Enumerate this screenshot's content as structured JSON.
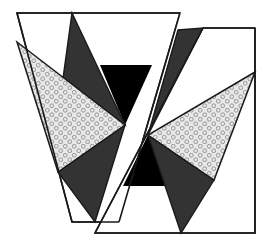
{
  "figure": {
    "canvas": {
      "width": 267,
      "height": 249,
      "background": "#ffffff"
    },
    "colors": {
      "background": "#ffffff",
      "outline": "#1a1a1a",
      "dark_gray": "#333333",
      "black": "#000000",
      "dotted_fill": "#e8e8e8",
      "dot_stroke": "#8c8c8c",
      "panel_fill": "#ffffff"
    },
    "stroke_width": 1.6,
    "pattern": {
      "name": "small-open-circles",
      "tile": 9,
      "radius": 1.9,
      "stroke_width": 0.9
    },
    "shapes": [
      {
        "name": "left-panel-outline",
        "kind": "polygon",
        "fill": "panel_fill",
        "stroke": "outline",
        "points": "17,13 180,13 119,222 72,222"
      },
      {
        "name": "left-dark-triangle-upper",
        "kind": "polygon",
        "fill": "dark_gray",
        "stroke": "outline",
        "points": "72,13 125,125 62,86"
      },
      {
        "name": "left-black-wedge",
        "kind": "polygon",
        "fill": "black",
        "stroke": "none",
        "points": "100,65 152,65 125,125"
      },
      {
        "name": "left-dotted-triangle",
        "kind": "polygon",
        "fill": "dotted_fill",
        "stroke": "outline",
        "points": "17,42 125,125 58,172"
      },
      {
        "name": "left-dark-triangle-lower",
        "kind": "polygon",
        "fill": "dark_gray",
        "stroke": "outline",
        "points": "58,172 125,125 95,222"
      },
      {
        "name": "right-panel-outline",
        "kind": "polygon",
        "fill": "panel_fill",
        "stroke": "outline",
        "points": "203,28 255,28 255,233 95,233"
      },
      {
        "name": "right-dark-triangle-upper",
        "kind": "polygon",
        "fill": "dark_gray",
        "stroke": "outline",
        "points": "203,28 148,135 178,30"
      },
      {
        "name": "right-black-wedge",
        "kind": "polygon",
        "fill": "black",
        "stroke": "none",
        "points": "123,186 175,186 148,135"
      },
      {
        "name": "right-dotted-triangle",
        "kind": "polygon",
        "fill": "dotted_fill",
        "stroke": "outline",
        "points": "255,72 148,135 214,180"
      },
      {
        "name": "right-dark-triangle-lower",
        "kind": "polygon",
        "fill": "dark_gray",
        "stroke": "outline",
        "points": "148,135 214,180 181,233"
      }
    ]
  }
}
